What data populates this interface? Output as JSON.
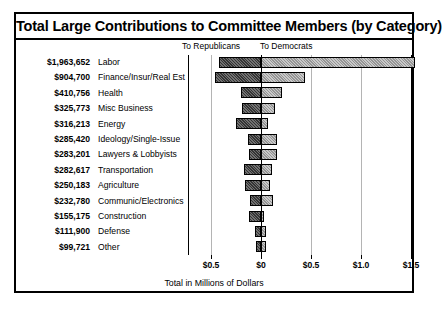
{
  "chart_data": {
    "type": "bar",
    "subtype": "diverging-horizontal-stacked",
    "title": "Total Large Contributions to Committee Members (by Category)",
    "xlabel": "Total in Millions of Dollars",
    "ylabel": "",
    "xlim": [
      -0.5,
      1.6
    ],
    "grid": true,
    "legend_position": "top",
    "axis_unit": "millions of dollars",
    "tick_labels": [
      "$0.5",
      "$0",
      "$0.5",
      "$1.0",
      "$1.5"
    ],
    "tick_values": [
      -0.5,
      0,
      0.5,
      1.0,
      1.5
    ],
    "column_headers": {
      "left": "To Republicans",
      "right": "To Democrats"
    },
    "series": [
      {
        "name": "To Republicans",
        "direction": "left",
        "color": "#343434"
      },
      {
        "name": "To Democrats",
        "direction": "right",
        "color": "#c9c9c9"
      }
    ],
    "categories": [
      "Labor",
      "Finance/Insur/Real Est",
      "Health",
      "Misc Business",
      "Energy",
      "Ideology/Single-Issue",
      "Lawyers & Lobbyists",
      "Transportation",
      "Agriculture",
      "Communic/Electronics",
      "Construction",
      "Defense",
      "Other"
    ],
    "total_labels": [
      "$1,963,652",
      "$904,700",
      "$410,756",
      "$325,773",
      "$316,213",
      "$285,420",
      "$283,201",
      "$282,617",
      "$250,183",
      "$232,780",
      "$155,175",
      "$111,900",
      "$99,721"
    ],
    "rows": [
      {
        "category": "Labor",
        "total": "$1,963,652",
        "republicans": 0.42,
        "democrats": 1.54
      },
      {
        "category": "Finance/Insur/Real Est",
        "total": "$904,700",
        "republicans": 0.46,
        "democrats": 0.44
      },
      {
        "category": "Health",
        "total": "$410,756",
        "republicans": 0.2,
        "democrats": 0.21
      },
      {
        "category": "Misc Business",
        "total": "$325,773",
        "republicans": 0.19,
        "democrats": 0.14
      },
      {
        "category": "Energy",
        "total": "$316,213",
        "republicans": 0.25,
        "democrats": 0.07
      },
      {
        "category": "Ideology/Single-Issue",
        "total": "$285,420",
        "republicans": 0.13,
        "democrats": 0.16
      },
      {
        "category": "Lawyers & Lobbyists",
        "total": "$283,201",
        "republicans": 0.12,
        "democrats": 0.16
      },
      {
        "category": "Transportation",
        "total": "$282,617",
        "republicans": 0.17,
        "democrats": 0.11
      },
      {
        "category": "Agriculture",
        "total": "$250,183",
        "republicans": 0.16,
        "democrats": 0.09
      },
      {
        "category": "Communic/Electronics",
        "total": "$232,780",
        "republicans": 0.11,
        "democrats": 0.12
      },
      {
        "category": "Construction",
        "total": "$155,175",
        "republicans": 0.12,
        "democrats": 0.03
      },
      {
        "category": "Defense",
        "total": "$111,900",
        "republicans": 0.06,
        "democrats": 0.05
      },
      {
        "category": "Other",
        "total": "$99,721",
        "republicans": 0.05,
        "democrats": 0.05
      }
    ]
  }
}
